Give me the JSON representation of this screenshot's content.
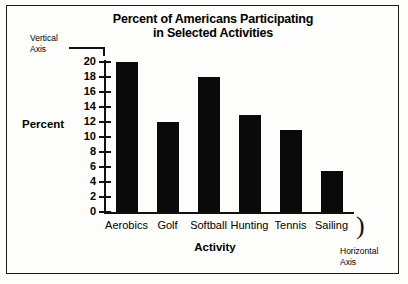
{
  "chart_data": {
    "type": "bar",
    "title": "Percent of Americans Participating in Selected Activities",
    "title_line1": "Percent of Americans Participating",
    "title_line2": "in Selected Activities",
    "xlabel": "Activity",
    "ylabel": "Percent",
    "categories": [
      "Aerobics",
      "Golf",
      "Softball",
      "Hunting",
      "Tennis",
      "Sailing"
    ],
    "values": [
      20,
      12,
      18,
      13,
      11,
      5.5
    ],
    "ylim": [
      0,
      20
    ],
    "ytick_step": 2,
    "yticks": [
      20,
      18,
      16,
      14,
      12,
      10,
      8,
      6,
      4,
      2,
      0
    ],
    "grid": false,
    "legend": "none",
    "bar_color": "#0a0a0a"
  },
  "annotations": {
    "vertical_axis": {
      "line1": "Vertical",
      "line2": "Axis"
    },
    "horizontal_axis": {
      "line1": "Horizontal",
      "line2": "Axis"
    },
    "brace_glyph": ")"
  }
}
